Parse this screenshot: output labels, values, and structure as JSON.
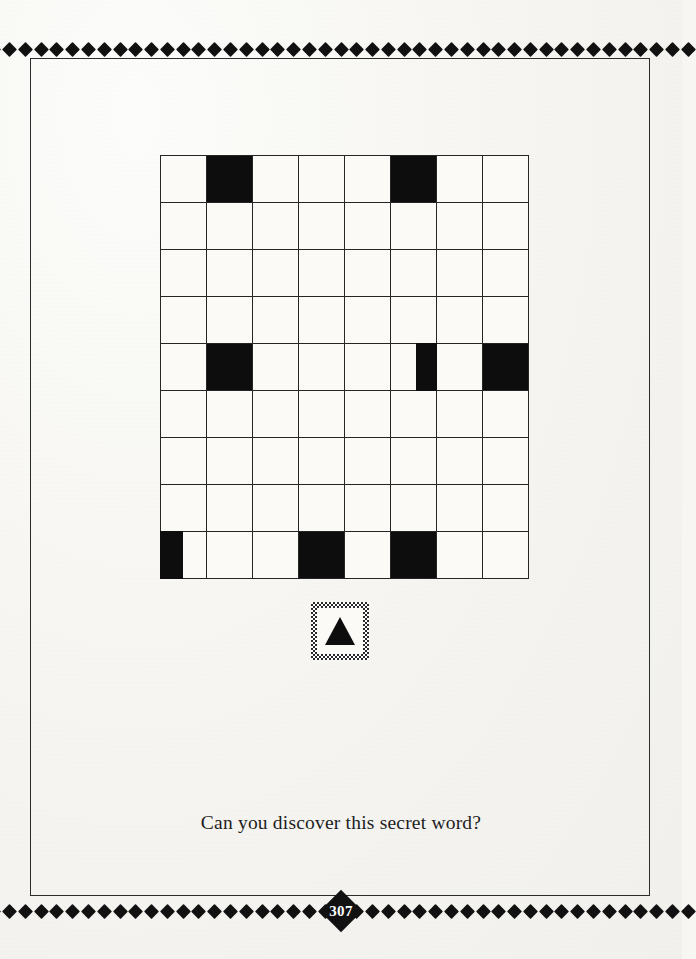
{
  "page": {
    "background_color": "#f7f6f3",
    "ink_color": "#111111",
    "page_number": "307"
  },
  "decoration": {
    "top_diamond_count": 45,
    "bottom_diamond_count": 45,
    "diamond_icon": "diamond-icon",
    "frame": "thin-rectangular-rule"
  },
  "puzzle": {
    "type": "grid",
    "rows": 9,
    "columns": 8,
    "cell_fill_color": "#0d0d0d",
    "cell_empty_color": "#fbfaf7",
    "grid": [
      [
        "empty",
        "full",
        "empty",
        "empty",
        "empty",
        "full",
        "empty",
        "empty"
      ],
      [
        "empty",
        "empty",
        "empty",
        "empty",
        "empty",
        "empty",
        "empty",
        "empty"
      ],
      [
        "empty",
        "empty",
        "empty",
        "empty",
        "empty",
        "empty",
        "empty",
        "empty"
      ],
      [
        "empty",
        "empty",
        "empty",
        "empty",
        "empty",
        "empty",
        "empty",
        "empty"
      ],
      [
        "empty",
        "full",
        "empty",
        "empty",
        "empty",
        "right",
        "empty",
        "full"
      ],
      [
        "empty",
        "empty",
        "empty",
        "empty",
        "empty",
        "empty",
        "empty",
        "empty"
      ],
      [
        "empty",
        "empty",
        "empty",
        "empty",
        "empty",
        "empty",
        "empty",
        "empty"
      ],
      [
        "empty",
        "empty",
        "empty",
        "empty",
        "empty",
        "empty",
        "empty",
        "empty"
      ],
      [
        "left",
        "empty",
        "empty",
        "full",
        "empty",
        "full",
        "empty",
        "empty"
      ]
    ]
  },
  "marker": {
    "icon": "triangle-up-icon",
    "border_style": "checkered-dither"
  },
  "caption": {
    "text": "Can you discover this secret word?"
  }
}
